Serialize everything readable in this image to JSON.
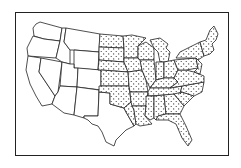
{
  "map": {
    "subject": "Contiguous United States",
    "highlight": "Eastern states stippled with dot pattern",
    "colors": {
      "outline": "#222222",
      "background": "#ffffff",
      "stipple": "#222222"
    }
  }
}
